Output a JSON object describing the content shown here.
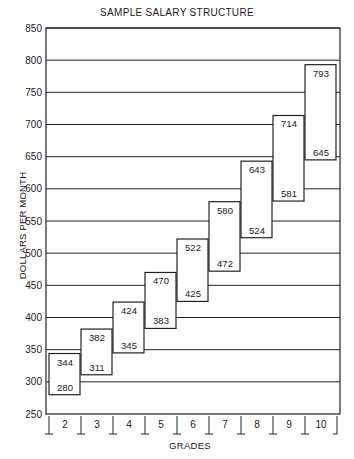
{
  "chart_data": {
    "type": "bar",
    "subtype": "floating-range",
    "title": "SAMPLE SALARY STRUCTURE",
    "xlabel": "GRADES",
    "ylabel": "DOLLARS PER MONTH",
    "ylim": [
      250,
      850
    ],
    "yticks": [
      250,
      300,
      350,
      400,
      450,
      500,
      550,
      600,
      650,
      700,
      750,
      800,
      850
    ],
    "grid": true,
    "legend": null,
    "categories": [
      "2",
      "3",
      "4",
      "5",
      "6",
      "7",
      "8",
      "9",
      "10"
    ],
    "series": [
      {
        "name": "Minimum",
        "values": [
          280,
          311,
          345,
          383,
          425,
          472,
          524,
          581,
          645
        ]
      },
      {
        "name": "Maximum",
        "values": [
          344,
          382,
          424,
          470,
          522,
          580,
          643,
          714,
          793
        ]
      }
    ]
  }
}
